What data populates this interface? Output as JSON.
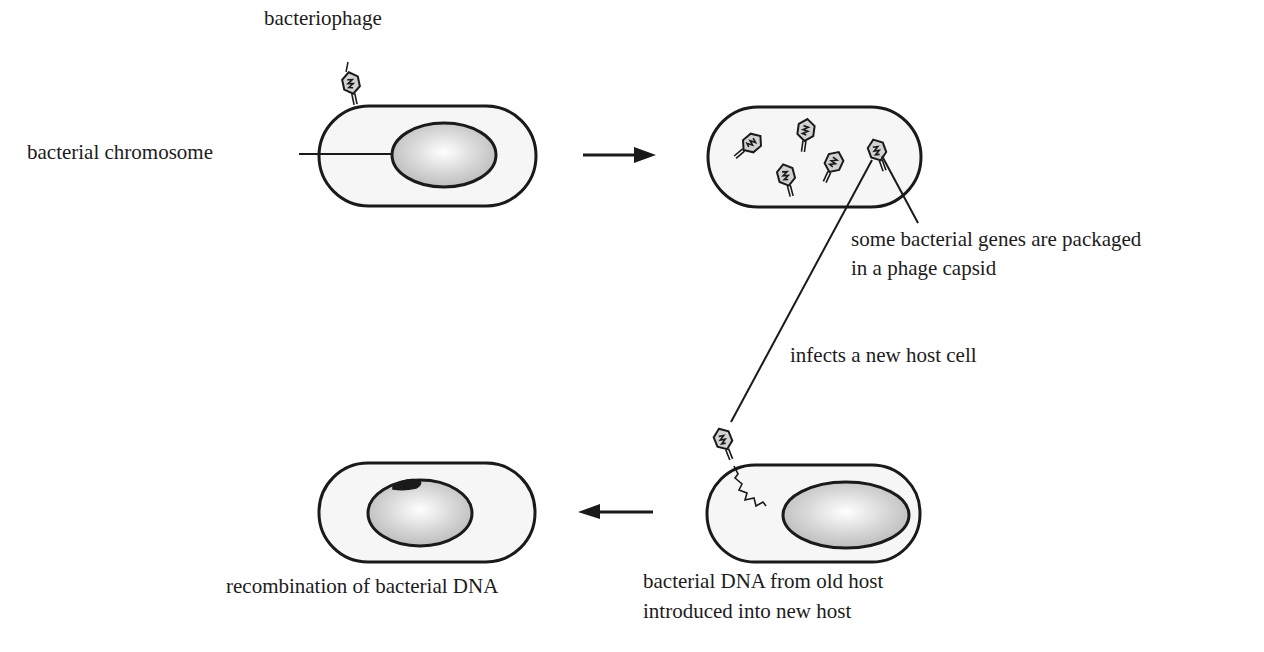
{
  "diagram": {
    "type": "process-flow",
    "topic": "generalized transduction by bacteriophage",
    "labels": {
      "bacteriophage": "bacteriophage",
      "bacterial_chromosome": "bacterial chromosome",
      "packaged_line1": "some bacterial genes are packaged",
      "packaged_line2": "in a phage capsid",
      "infects": "infects a new host cell",
      "introduced_line1": "bacterial DNA from old host",
      "introduced_line2": "introduced into new host",
      "recombination": "recombination of bacterial DNA"
    },
    "stages": [
      {
        "id": "infection",
        "description": "phage attaches to bacterial cell with chromosome"
      },
      {
        "id": "replication",
        "description": "new phages assembled inside cell; one carries bacterial genes"
      },
      {
        "id": "transduction",
        "description": "transducing phage injects bacterial DNA into new host"
      },
      {
        "id": "recombination",
        "description": "donor DNA recombined into recipient chromosome"
      }
    ],
    "flow": [
      "infection -> replication",
      "replication -> transduction",
      "transduction -> recombination"
    ],
    "colors": {
      "outline": "#1a1a1a",
      "cell_fill": "#f4f4f4",
      "nucleoid_fill_center": "#ffffff",
      "nucleoid_fill_edge": "#bdbdbd",
      "phage_fill": "#cfcfcf",
      "recombined_segment": "#1a1a1a"
    }
  }
}
